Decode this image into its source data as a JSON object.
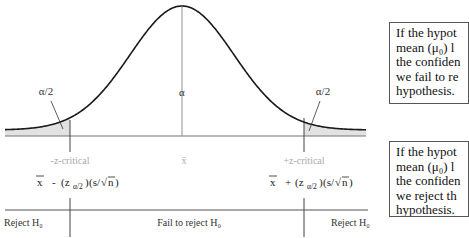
{
  "diagram": {
    "curve": {
      "type": "normal-distribution",
      "center_label": "α",
      "left_tail_label": "α/2",
      "right_tail_label": "α/2",
      "tail_fill_color": "#e2e2e2",
      "curve_color": "#1a1a1a"
    },
    "axis_labels": {
      "left_critical": "-z-critical",
      "center": "x̄",
      "right_critical": "+z-critical"
    },
    "formulas": {
      "left": {
        "xbar": "x",
        "op": "-",
        "z": "(z",
        "sub": "α/2",
        "close": ")",
        "se_open": "(s/",
        "sqrt_sym": "√",
        "n": "n",
        "se_close": " )"
      },
      "right": {
        "xbar": "x",
        "op": "+",
        "z": "(z",
        "sub": "α/2",
        "close": ")",
        "se_open": "(s/",
        "sqrt_sym": "√",
        "n": "n",
        "se_close": " )"
      }
    },
    "regions": {
      "left": "Reject H₀",
      "middle": "Fail to reject H₀",
      "right": "Reject H₀"
    },
    "notes": {
      "top": [
        "If the hypot",
        "mean (μ₀) l",
        "the confiden",
        "we fail to re",
        "hypothesis."
      ],
      "bottom": [
        "If the hypot",
        "mean (μ₀) l",
        "the confiden",
        "we reject th",
        "hypothesis."
      ]
    }
  }
}
